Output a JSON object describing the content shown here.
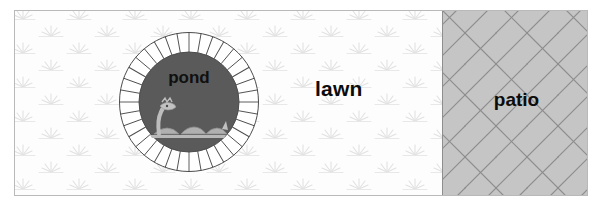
{
  "diagram": {
    "regions": [
      {
        "id": "lawn",
        "label": "lawn",
        "fill_color": "#fdfdfd",
        "pattern": "grass-tufts",
        "pattern_color": "#dcdcdc"
      },
      {
        "id": "pond",
        "label": "pond",
        "shape": "circle",
        "water_color": "#5a5a5a",
        "ring_color": "#ffffff",
        "ring_outline_color": "#4a4a4a",
        "ring_segments": 36,
        "feature_icon": "loch-ness-monster-icon",
        "feature_color": "#b5b5b5"
      },
      {
        "id": "patio",
        "label": "patio",
        "fill_color": "#c3c3c3",
        "pattern": "herringbone-brick",
        "mortar_color": "#8e8e8e"
      }
    ],
    "frame": {
      "border_color": "#b9b9b9"
    }
  }
}
